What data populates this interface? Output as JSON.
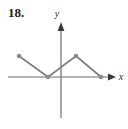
{
  "figure": {
    "problem_number": "18.",
    "axis_labels": {
      "x": "x",
      "y": "y"
    },
    "colors": {
      "curve": "#7f7f7f",
      "point": "#8c8c8c",
      "axis": "#6e6e6e",
      "label": "#1a1a1a"
    }
  },
  "chart_data": {
    "type": "line",
    "title": "",
    "xlabel": "x",
    "ylabel": "y",
    "grid": false,
    "legend": null,
    "origin_px": {
      "x": 61,
      "y": 77
    },
    "axis_ranges_px": {
      "x_axis_from": 8,
      "x_axis_to": 115,
      "y_axis_from": 22,
      "y_axis_to": 118
    },
    "points_px": [
      {
        "x": 19,
        "y": 56
      },
      {
        "x": 48,
        "y": 77
      },
      {
        "x": 76,
        "y": 56
      },
      {
        "x": 101,
        "y": 77
      }
    ],
    "x": [
      -3,
      -1,
      1,
      2.75
    ],
    "values": [
      1.5,
      0,
      1.5,
      0
    ],
    "markers": true,
    "marker_count": 4
  }
}
